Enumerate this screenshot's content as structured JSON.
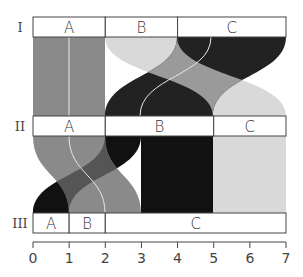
{
  "diagram": {
    "type": "partition-flow",
    "axis": {
      "ticks": [
        "0",
        "1",
        "2",
        "3",
        "4",
        "5",
        "6",
        "7"
      ],
      "min": 0,
      "max": 7
    },
    "levels": [
      {
        "label": "I",
        "partitions": [
          {
            "label": "A",
            "start": 0,
            "end": 2
          },
          {
            "label": "B",
            "start": 2,
            "end": 4
          },
          {
            "label": "C",
            "start": 4,
            "end": 7
          }
        ]
      },
      {
        "label": "II",
        "partitions": [
          {
            "label": "A",
            "start": 0,
            "end": 2
          },
          {
            "label": "B",
            "start": 2,
            "end": 5
          },
          {
            "label": "C",
            "start": 5,
            "end": 7
          }
        ]
      },
      {
        "label": "III",
        "partitions": [
          {
            "label": "A",
            "start": 0,
            "end": 1
          },
          {
            "label": "B",
            "start": 1,
            "end": 2
          },
          {
            "label": "C",
            "start": 2,
            "end": 7
          }
        ]
      }
    ],
    "flows_I_II": [
      {
        "from": [
          0,
          2
        ],
        "to": [
          0,
          2
        ],
        "color": "#8a8a8a"
      },
      {
        "from": [
          2,
          4
        ],
        "to": [
          5,
          7
        ],
        "color": "#d9d9d9"
      },
      {
        "from": [
          4,
          7
        ],
        "to": [
          2,
          5
        ],
        "color": "#111111"
      }
    ],
    "flows_II_III": [
      {
        "from": [
          2,
          3
        ],
        "to": [
          0,
          1
        ],
        "color": "#111111"
      },
      {
        "from": [
          0,
          2
        ],
        "to": [
          1,
          3
        ],
        "color": "#8a8a8a"
      },
      {
        "from": [
          3,
          5
        ],
        "to": [
          3,
          5
        ],
        "color": "#111111"
      },
      {
        "from": [
          5,
          7
        ],
        "to": [
          5,
          7
        ],
        "color": "#d9d9d9"
      }
    ],
    "colors": {
      "gray": "#8a8a8a",
      "light": "#d9d9d9",
      "black": "#111111",
      "overlap_light_black": "#9a9a9a",
      "overlap_gray_black": "#555555",
      "guide_line": "#e8e8e8",
      "border": "#444444"
    }
  }
}
